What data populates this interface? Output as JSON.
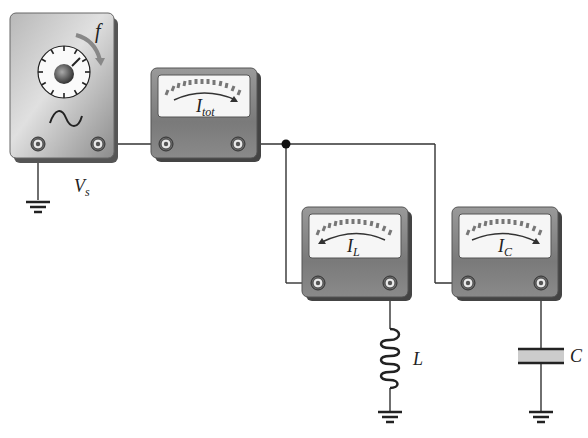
{
  "diagram": {
    "type": "circuit",
    "source": {
      "label": "V",
      "label_sub": "s",
      "frequency_label": "f",
      "waveform_symbol": "~"
    },
    "meters": [
      {
        "id": "total",
        "label": "I",
        "label_sub": "tot",
        "needle_direction": "right"
      },
      {
        "id": "inductor",
        "label": "I",
        "label_sub": "L",
        "needle_direction": "left"
      },
      {
        "id": "capacitor",
        "label": "I",
        "label_sub": "C",
        "needle_direction": "right"
      }
    ],
    "components": [
      {
        "id": "inductor",
        "label": "L"
      },
      {
        "id": "capacitor",
        "label": "C"
      }
    ],
    "colors": {
      "case": "#8a8a8a",
      "case_dark": "#555555",
      "face": "#f4f4f4",
      "wire": "#333333",
      "capacitor_fill": "#cccccc"
    }
  }
}
